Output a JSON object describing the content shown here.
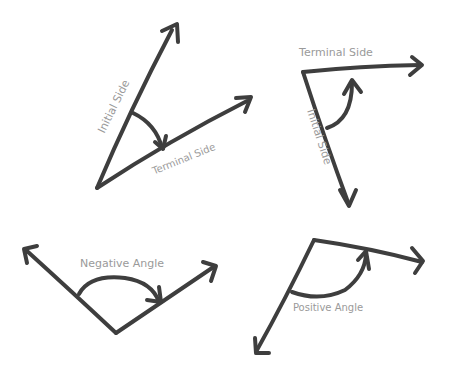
{
  "diagrams": [
    {
      "id": "angle-1",
      "labels": {
        "initial": "Initial Side",
        "terminal": "Terminal Side"
      }
    },
    {
      "id": "angle-2",
      "labels": {
        "initial": "Initial Side",
        "terminal": "Terminal Side"
      }
    },
    {
      "id": "negative-angle",
      "labels": {
        "caption": "Negative Angle"
      }
    },
    {
      "id": "positive-angle",
      "labels": {
        "caption": "Positive Angle"
      }
    }
  ],
  "colors": {
    "stroke": "#3e3e3e",
    "label": "#9a9a9a",
    "background": "#ffffff"
  }
}
